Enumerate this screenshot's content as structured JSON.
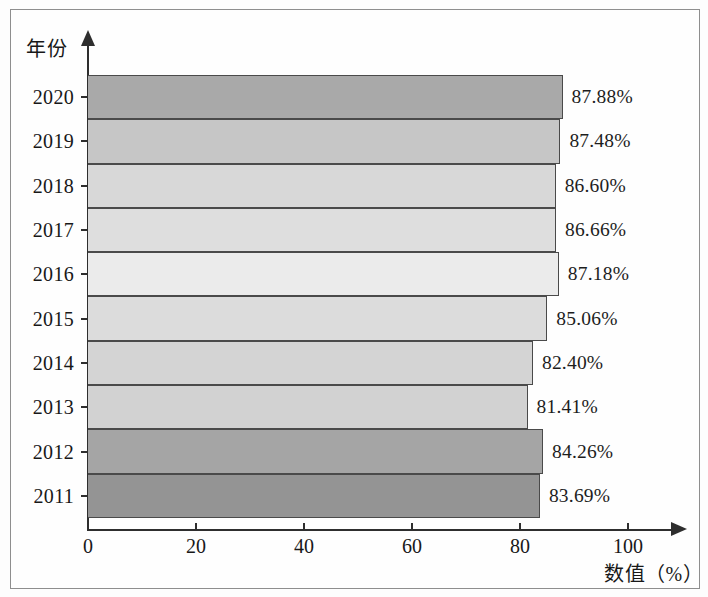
{
  "chart_data": {
    "type": "bar",
    "orientation": "horizontal",
    "title": "",
    "xlabel": "数值（%）",
    "ylabel": "年份",
    "categories": [
      "2020",
      "2019",
      "2018",
      "2017",
      "2016",
      "2015",
      "2014",
      "2013",
      "2012",
      "2011"
    ],
    "values": [
      87.88,
      87.48,
      86.6,
      86.66,
      87.18,
      85.06,
      82.4,
      81.41,
      84.26,
      83.69
    ],
    "data_labels": [
      "87.88%",
      "87.48%",
      "86.60%",
      "86.66%",
      "87.18%",
      "85.06%",
      "82.40%",
      "81.41%",
      "84.26%",
      "83.69%"
    ],
    "bar_colors": [
      "#a9a9a9",
      "#c6c6c6",
      "#d8d8d8",
      "#dedede",
      "#ebebeb",
      "#dcdcdc",
      "#d4d4d4",
      "#d2d2d2",
      "#a5a5a5",
      "#949494"
    ],
    "xlim": [
      0,
      100
    ],
    "xticks": [
      "0",
      "20",
      "40",
      "60",
      "80",
      "100"
    ],
    "xtick_values": [
      0,
      20,
      40,
      60,
      80,
      100
    ],
    "grid": false,
    "legend": false
  },
  "axes": {
    "y_title": "年份",
    "x_title": "数值（%）"
  }
}
